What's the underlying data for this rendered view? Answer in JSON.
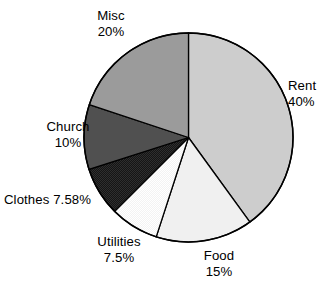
{
  "chart_data": {
    "type": "pie",
    "title": "",
    "subtitle": "",
    "xlabel": "",
    "ylabel": "",
    "legend_position": "none",
    "grid": false,
    "labels_on_slices": false,
    "label_format": "name + percent",
    "start_angle_deg": 0,
    "direction": "clockwise",
    "categories": [
      "Rent",
      "Food",
      "Utilities",
      "Clothes",
      "Church",
      "Misc"
    ],
    "values": [
      40,
      15,
      7.5,
      7.58,
      10,
      20
    ],
    "value_texts": [
      "40%",
      "15%",
      "7.5%",
      "7.58%",
      "10%",
      "20%"
    ],
    "colors": [
      "#cdcdcd",
      "#f0f0f0",
      "#fbfbfb",
      "#1d1d1d",
      "#505050",
      "#9b9b9b"
    ],
    "outline_color": "#000000",
    "slices": [
      {
        "name": "Rent",
        "value": 40,
        "value_text": "40%",
        "color": "#cdcdcd",
        "start_deg": 0,
        "end_deg": 144
      },
      {
        "name": "Food",
        "value": 15,
        "value_text": "15%",
        "color": "#f0f0f0",
        "start_deg": 144,
        "end_deg": 198
      },
      {
        "name": "Utilities",
        "value": 7.5,
        "value_text": "7.5%",
        "color": "#fbfbfb",
        "start_deg": 198,
        "end_deg": 225
      },
      {
        "name": "Clothes",
        "value": 7.58,
        "value_text": "7.58%",
        "color": "#1d1d1d",
        "start_deg": 225,
        "end_deg": 252.3
      },
      {
        "name": "Church",
        "value": 10,
        "value_text": "10%",
        "color": "#505050",
        "start_deg": 252.3,
        "end_deg": 288.3
      },
      {
        "name": "Misc",
        "value": 20,
        "value_text": "20%",
        "color": "#9b9b9b",
        "start_deg": 288.3,
        "end_deg": 360
      }
    ]
  },
  "labels": {
    "misc": {
      "name": "Misc",
      "value": "20%"
    },
    "rent": {
      "name": "Rent",
      "value": "40%"
    },
    "food": {
      "name": "Food",
      "value": "15%"
    },
    "utilities": {
      "name": "Utilities",
      "value": "7.5%"
    },
    "clothes": {
      "name": "Clothes ",
      "value": "7.58%"
    },
    "church": {
      "name": "Church",
      "value": "10%"
    }
  }
}
